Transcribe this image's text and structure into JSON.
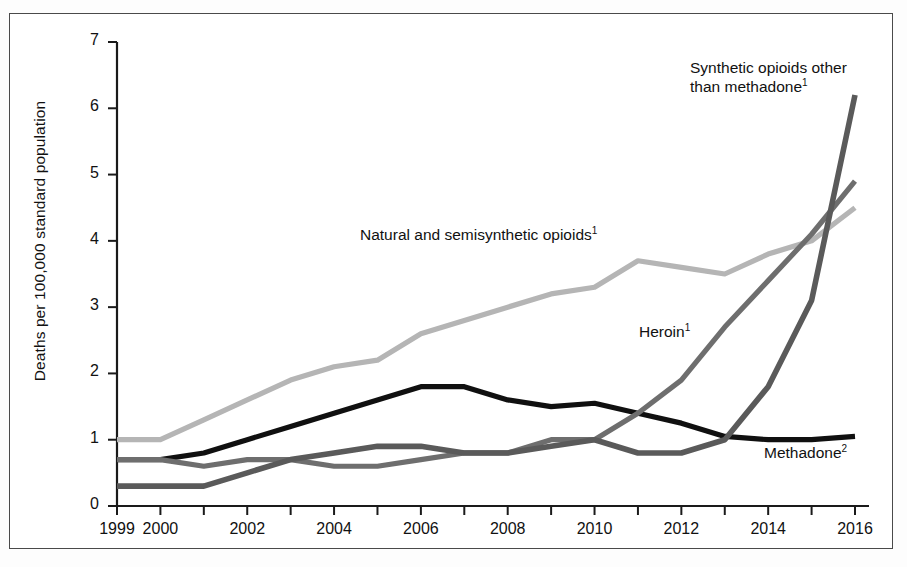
{
  "chart_data": {
    "type": "line",
    "title": "",
    "xlabel": "",
    "ylabel": "Deaths per 100,000 standard population",
    "x": [
      1999,
      2000,
      2001,
      2002,
      2003,
      2004,
      2005,
      2006,
      2007,
      2008,
      2009,
      2010,
      2011,
      2012,
      2013,
      2014,
      2015,
      2016
    ],
    "xlim": [
      1999,
      2016
    ],
    "ylim": [
      0,
      7
    ],
    "xtick_labels": [
      "1999",
      "2000",
      "2002",
      "2004",
      "2006",
      "2008",
      "2010",
      "2012",
      "2014",
      "2016"
    ],
    "xtick_values": [
      1999,
      2000,
      2002,
      2004,
      2006,
      2008,
      2010,
      2012,
      2014,
      2016
    ],
    "ytick_labels": [
      "0",
      "1",
      "2",
      "3",
      "4",
      "5",
      "6",
      "7"
    ],
    "ytick_values": [
      0,
      1,
      2,
      3,
      4,
      5,
      6,
      7
    ],
    "grid": false,
    "legend_position": "inline-annotations",
    "series": [
      {
        "name": "Natural and semisynthetic opioids",
        "label": "Natural and semisynthetic opioids",
        "footnote": "1",
        "color": "#b5b5b5",
        "width": 5.2,
        "values": [
          1.0,
          1.0,
          1.3,
          1.6,
          1.9,
          2.1,
          2.2,
          2.6,
          2.8,
          3.0,
          3.2,
          3.3,
          3.7,
          3.6,
          3.5,
          3.8,
          4.0,
          4.5
        ]
      },
      {
        "name": "Methadone",
        "label": "Methadone",
        "footnote": "2",
        "color": "#101010",
        "width": 5.2,
        "values": [
          0.7,
          0.7,
          0.8,
          1.0,
          1.2,
          1.4,
          1.6,
          1.8,
          1.8,
          1.6,
          1.5,
          1.55,
          1.4,
          1.25,
          1.05,
          1.0,
          1.0,
          1.05
        ]
      },
      {
        "name": "Heroin",
        "label": "Heroin",
        "footnote": "1",
        "color": "#6e6e6e",
        "width": 5.2,
        "values": [
          0.7,
          0.7,
          0.6,
          0.7,
          0.7,
          0.6,
          0.6,
          0.7,
          0.8,
          0.8,
          1.0,
          1.0,
          1.4,
          1.9,
          2.7,
          3.4,
          4.1,
          4.9
        ]
      },
      {
        "name": "Synthetic opioids other than methadone",
        "label": "Synthetic opioids other than methadone",
        "footnote": "1",
        "color": "#5a5a5a",
        "width": 5.6,
        "values": [
          0.3,
          0.3,
          0.3,
          0.5,
          0.7,
          0.8,
          0.9,
          0.9,
          0.8,
          0.8,
          0.9,
          1.0,
          0.8,
          0.8,
          1.0,
          1.8,
          3.1,
          6.2
        ]
      }
    ]
  },
  "axis": {
    "y_title": "Deaths per 100,000 standard population"
  },
  "labels": {
    "synthetic_line1": "Synthetic opioids other",
    "synthetic_line2": "than methadone",
    "synthetic_sup": "1",
    "natural": "Natural and semisynthetic opioids",
    "natural_sup": "1",
    "heroin": "Heroin",
    "heroin_sup": "1",
    "methadone": "Methadone",
    "methadone_sup": "2"
  }
}
